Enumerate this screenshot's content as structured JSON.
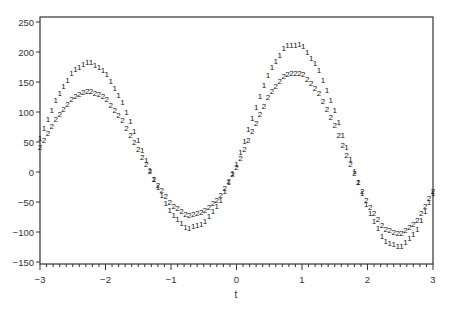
{
  "chart_data": {
    "type": "line",
    "title": "",
    "xlabel": "t",
    "ylabel": "",
    "xlim": [
      -3,
      3
    ],
    "ylim": [
      -153,
      258
    ],
    "grid": false,
    "legend": "none (series drawn with symbols '1' and '2')",
    "x_ticks": [
      "-3",
      "-2",
      "-1",
      "0",
      "1",
      "2",
      "3"
    ],
    "y_ticks": [
      "250",
      "200",
      "150",
      "100",
      "50",
      "0",
      "-50",
      "-100",
      "-150"
    ],
    "x": [
      -3,
      -2.75,
      -2.5,
      -2.25,
      -2,
      -1.75,
      -1.5,
      -1.25,
      -1,
      -0.75,
      -0.5,
      -0.25,
      0,
      0.25,
      0.5,
      0.75,
      1,
      1.25,
      1.5,
      1.75,
      2,
      2.25,
      2.5,
      2.75,
      3
    ],
    "series": [
      {
        "name": "1",
        "symbol": "1",
        "values": [
          57,
          122,
          169,
          185,
          167,
          119,
          53,
          -15,
          -68,
          -94,
          -85,
          -50,
          14,
          94,
          168,
          211,
          213,
          173,
          103,
          18,
          -60,
          -113,
          -126,
          -98,
          -35
        ]
      },
      {
        "name": "2",
        "symbol": "2",
        "values": [
          41,
          90,
          125,
          137,
          124,
          88,
          38,
          -13,
          -53,
          -72,
          -66,
          -41,
          8,
          70,
          130,
          164,
          165,
          134,
          78,
          10,
          -52,
          -93,
          -104,
          -82,
          -32
        ]
      }
    ]
  },
  "axis": {
    "x_title": "t"
  }
}
